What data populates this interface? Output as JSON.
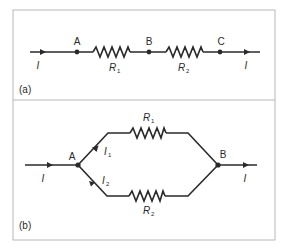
{
  "figure": {
    "frame_color": "#b8b8b8",
    "wire_color": "#2a2a2a",
    "panel_a": {
      "label": "(a)",
      "title": "Series connection",
      "nodes": [
        {
          "name": "A",
          "label": "A"
        },
        {
          "name": "B",
          "label": "B"
        },
        {
          "name": "C",
          "label": "C"
        }
      ],
      "resistors": [
        {
          "symbol": "R",
          "subscript": "1"
        },
        {
          "symbol": "R",
          "subscript": "2"
        }
      ],
      "current_in": "I",
      "current_out": "I"
    },
    "panel_b": {
      "label": "(b)",
      "title": "Parallel connection",
      "nodes": [
        {
          "name": "A",
          "label": "A"
        },
        {
          "name": "B",
          "label": "B"
        }
      ],
      "resistors": [
        {
          "symbol": "R",
          "subscript": "1"
        },
        {
          "symbol": "R",
          "subscript": "2"
        }
      ],
      "branch_currents": [
        {
          "symbol": "I",
          "subscript": "1"
        },
        {
          "symbol": "I",
          "subscript": "2"
        }
      ],
      "current_in": "I",
      "current_out": "I"
    }
  }
}
